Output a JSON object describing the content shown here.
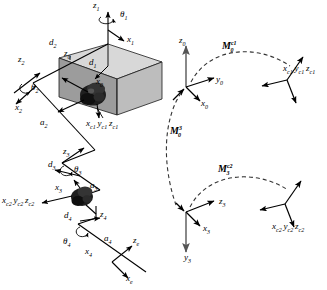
{
  "figure": {
    "panels": [
      {
        "id": "left",
        "name": "manipulator-linkage-panel"
      },
      {
        "id": "right",
        "name": "frame-transform-panel"
      }
    ]
  },
  "left_panel": {
    "name": "manipulator-linkage",
    "object_name": "camera-in-box",
    "labels": [
      {
        "id": "z1",
        "base": "z",
        "sub": "1",
        "sup": "",
        "x": 96,
        "y": 3,
        "kind": "axis"
      },
      {
        "id": "theta1",
        "base": "θ",
        "sub": "1",
        "sup": "",
        "x": 120,
        "y": 13,
        "kind": "joint-angle"
      },
      {
        "id": "x1",
        "base": "x",
        "sub": "1",
        "sup": "",
        "x": 126,
        "y": 38,
        "kind": "axis"
      },
      {
        "id": "d2",
        "base": "d",
        "sub": "2",
        "sup": "",
        "x": 51,
        "y": 40,
        "kind": "link-offset"
      },
      {
        "id": "z0",
        "base": "z",
        "sub": "0",
        "sup": "",
        "x": 66,
        "y": 54,
        "kind": "axis"
      },
      {
        "id": "d1",
        "base": "d",
        "sub": "1",
        "sup": "",
        "x": 90,
        "y": 61,
        "kind": "link-offset"
      },
      {
        "id": "z2",
        "base": "z",
        "sub": "2",
        "sup": "",
        "x": 20,
        "y": 58,
        "kind": "axis"
      },
      {
        "id": "x0",
        "base": "x",
        "sub": "0",
        "sup": "",
        "x": 96,
        "y": 80,
        "kind": "axis"
      },
      {
        "id": "theta2",
        "base": "θ",
        "sub": "2",
        "sup": "",
        "x": 31,
        "y": 85,
        "kind": "joint-angle"
      },
      {
        "id": "x2",
        "base": "x",
        "sub": "2",
        "sup": "",
        "x": 16,
        "y": 105,
        "kind": "axis"
      },
      {
        "id": "a2",
        "base": "a",
        "sub": "2",
        "sup": "",
        "x": 41,
        "y": 120,
        "kind": "link-length"
      },
      {
        "id": "c1frame",
        "base": "x",
        "sub": "c1",
        "sup": "",
        "x": 89,
        "y": 120,
        "kind": "camera-frame"
      },
      {
        "id": "z3",
        "base": "z",
        "sub": "3",
        "sup": "",
        "x": 64,
        "y": 152,
        "kind": "axis"
      },
      {
        "id": "d3",
        "base": "d",
        "sub": "3",
        "sup": "",
        "x": 50,
        "y": 163,
        "kind": "link-offset"
      },
      {
        "id": "theta3",
        "base": "θ",
        "sub": "3",
        "sup": "",
        "x": 75,
        "y": 168,
        "kind": "joint-angle"
      },
      {
        "id": "a3",
        "base": "a",
        "sub": "3",
        "sup": "",
        "x": 90,
        "y": 184,
        "kind": "link-length"
      },
      {
        "id": "x3",
        "base": "x",
        "sub": "3",
        "sup": "",
        "x": 56,
        "y": 186,
        "kind": "axis"
      },
      {
        "id": "c2frame",
        "base": "x",
        "sub": "c2",
        "sup": "",
        "x": 4,
        "y": 198,
        "kind": "camera-frame"
      },
      {
        "id": "d4",
        "base": "d",
        "sub": "4",
        "sup": "",
        "x": 66,
        "y": 214,
        "kind": "link-offset"
      },
      {
        "id": "z4",
        "base": "z",
        "sub": "4",
        "sup": "",
        "x": 93,
        "y": 213,
        "kind": "axis"
      },
      {
        "id": "theta4",
        "base": "θ",
        "sub": "4",
        "sup": "",
        "x": 65,
        "y": 240,
        "kind": "joint-angle"
      },
      {
        "id": "a4",
        "base": "a",
        "sub": "4",
        "sup": "",
        "x": 104,
        "y": 237,
        "kind": "link-length"
      },
      {
        "id": "x4",
        "base": "x",
        "sub": "4",
        "sup": "",
        "x": 84,
        "y": 250,
        "kind": "axis"
      },
      {
        "id": "ze",
        "base": "z",
        "sub": "e",
        "sup": "",
        "x": 128,
        "y": 238,
        "kind": "axis"
      },
      {
        "id": "xe",
        "base": "x",
        "sub": "e",
        "sup": "",
        "x": 124,
        "y": 275,
        "kind": "axis"
      }
    ],
    "camera1_frame_text": "x",
    "camera1_frame_parts": [
      "x",
      "c1",
      "y",
      "c1",
      "z",
      "c1"
    ],
    "camera2_frame_parts": [
      "x",
      "c2",
      "y",
      "c2",
      "z",
      "c2"
    ]
  },
  "right_panel": {
    "name": "frame-transform-diagram",
    "frames": [
      {
        "id": "frame0",
        "axes": [
          "z",
          "0",
          "y",
          "0",
          "x",
          "0"
        ]
      },
      {
        "id": "frame3",
        "axes": [
          "z",
          "3",
          "x",
          "3",
          "y",
          "3"
        ]
      },
      {
        "id": "framec1",
        "axes": [
          "x",
          "c1",
          "y",
          "c1",
          "z",
          "c1"
        ]
      },
      {
        "id": "framec2",
        "axes": [
          "x",
          "c2",
          "y",
          "c2",
          "z",
          "c2"
        ]
      }
    ],
    "transforms": [
      {
        "id": "M0c1",
        "base": "M",
        "sub": "0",
        "sup": "c1",
        "x": 222,
        "y": 42
      },
      {
        "id": "M03",
        "base": "M",
        "sub": "0",
        "sup": "3",
        "x": 170,
        "y": 127
      },
      {
        "id": "M3c2",
        "base": "M",
        "sub": "3",
        "sup": "c2",
        "x": 218,
        "y": 165
      }
    ],
    "axis_labels": [
      {
        "id": "z0r",
        "base": "z",
        "sub": "0",
        "x": 180,
        "y": 41
      },
      {
        "id": "y0r",
        "base": "y",
        "sub": "0",
        "x": 216,
        "y": 82
      },
      {
        "id": "x0r",
        "base": "x",
        "sub": "0",
        "x": 201,
        "y": 101
      },
      {
        "id": "z3r",
        "base": "z",
        "sub": "3",
        "x": 219,
        "y": 203
      },
      {
        "id": "x3r",
        "base": "x",
        "sub": "3",
        "x": 203,
        "y": 227
      },
      {
        "id": "y3r",
        "base": "y",
        "sub": "3",
        "x": 184,
        "y": 257
      }
    ]
  },
  "colors": {
    "ink": "#000000",
    "box_top": "#d6d6d6",
    "box_front": "#9a9a9a",
    "box_side": "#b8b8b8",
    "camera_body": "#2a2a2a",
    "dashed": "#3a3a3a",
    "axis_gray": "#6b6b6b"
  }
}
